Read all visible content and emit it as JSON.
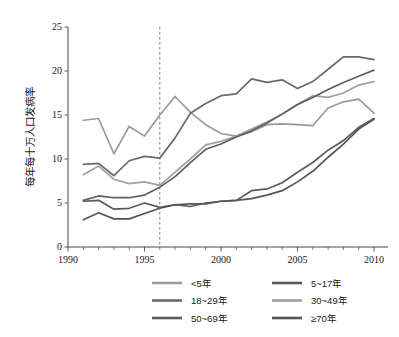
{
  "chart_data": {
    "type": "line",
    "title": "",
    "xlabel": "",
    "ylabel": "每年每十万人口发病率",
    "xlim": [
      1990,
      2010
    ],
    "ylim": [
      0,
      25
    ],
    "xticks": [
      1990,
      1995,
      2000,
      2005,
      2010
    ],
    "xtick_labels": [
      "1990",
      "1995",
      "2000",
      "2005",
      "2010"
    ],
    "yticks": [
      0,
      5,
      10,
      15,
      20,
      25
    ],
    "ytick_labels": [
      "0",
      "5",
      "10",
      "15",
      "20",
      "25"
    ],
    "x_minor_tick_step": 1,
    "grid": false,
    "legend_position": "bottom",
    "legend_columns": 2,
    "annotations": [
      {
        "type": "vertical-dashed-line",
        "x": 1996,
        "label": ""
      }
    ],
    "x": [
      1991,
      1992,
      1993,
      1994,
      1995,
      1996,
      1997,
      1998,
      1999,
      2000,
      2001,
      2002,
      2003,
      2004,
      2005,
      2006,
      2007,
      2008,
      2009,
      2010
    ],
    "series": [
      {
        "name": "<5年",
        "color": "#9a9a9a",
        "values": [
          14.4,
          14.6,
          10.6,
          13.7,
          12.6,
          15.0,
          17.1,
          15.3,
          13.9,
          12.9,
          12.6,
          13.1,
          13.9,
          14.0,
          13.9,
          13.8,
          15.8,
          16.5,
          16.8,
          15.2
        ]
      },
      {
        "name": "5~17年",
        "color": "#5a5a5a",
        "values": [
          5.2,
          5.3,
          4.3,
          4.4,
          5.0,
          4.5,
          4.8,
          4.6,
          5.0,
          5.2,
          5.3,
          6.4,
          6.6,
          7.3,
          8.5,
          9.6,
          11.0,
          12.1,
          13.6,
          14.6
        ]
      },
      {
        "name": "18~29年",
        "color": "#6a6a6a",
        "values": [
          9.4,
          9.5,
          8.1,
          9.8,
          10.3,
          10.1,
          12.4,
          15.2,
          16.3,
          17.2,
          17.4,
          19.1,
          18.7,
          19.0,
          18.0,
          18.8,
          20.2,
          21.6,
          21.6,
          21.3
        ]
      },
      {
        "name": "30~49年",
        "color": "#a0a0a0",
        "values": [
          8.2,
          9.2,
          7.7,
          7.2,
          7.4,
          7.0,
          8.5,
          10.0,
          11.6,
          12.0,
          12.6,
          13.4,
          14.2,
          15.1,
          16.2,
          17.2,
          17.0,
          17.5,
          18.4,
          18.8
        ]
      },
      {
        "name": "50~69年",
        "color": "#5e5e5e",
        "values": [
          5.3,
          5.8,
          5.6,
          5.6,
          5.9,
          6.8,
          8.0,
          9.6,
          11.1,
          11.7,
          12.5,
          13.2,
          14.1,
          15.1,
          16.2,
          17.0,
          17.9,
          18.7,
          19.4,
          20.1
        ]
      },
      {
        "name": "≥70年",
        "color": "#555555",
        "values": [
          3.1,
          3.9,
          3.2,
          3.2,
          3.8,
          4.4,
          4.8,
          4.9,
          4.9,
          5.2,
          5.3,
          5.5,
          5.9,
          6.4,
          7.4,
          8.6,
          10.2,
          11.7,
          13.4,
          14.5
        ]
      }
    ]
  }
}
